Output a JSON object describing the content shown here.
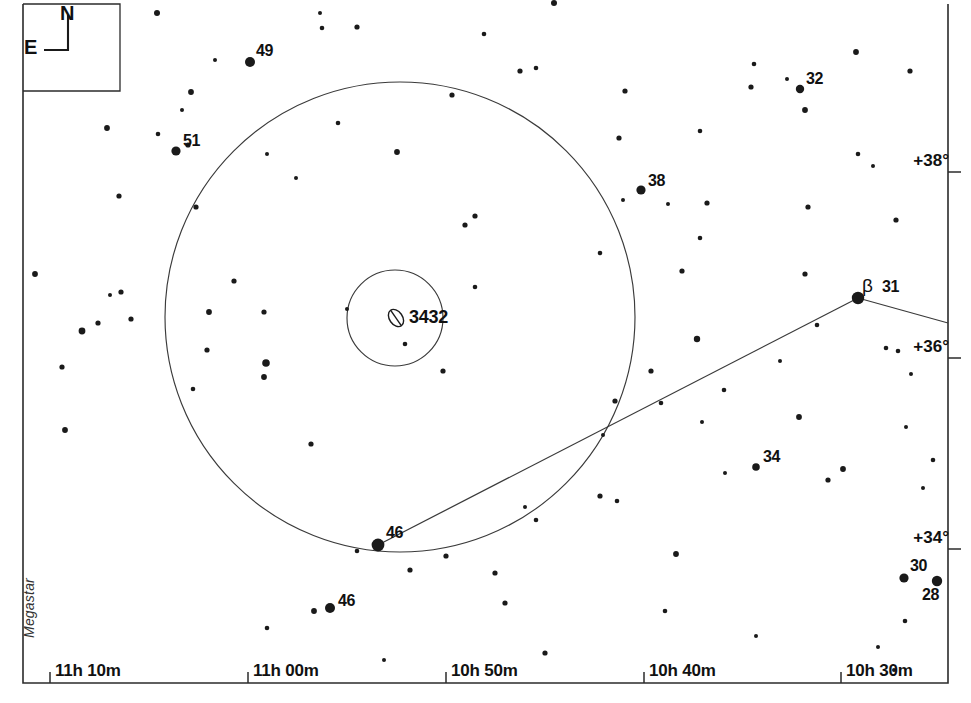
{
  "chart_data": {
    "type": "scatter",
    "title": "",
    "subtitle": "",
    "xlabel": "Right Ascension",
    "ylabel": "Declination",
    "grid": false,
    "legend_position": "none",
    "credit": "Megastar",
    "frame": {
      "left": 23,
      "top": 4,
      "right": 948,
      "bottom": 683
    },
    "ra_axis": {
      "tick_labels": [
        "11h 10m",
        "11h 00m",
        "10h 50m",
        "10h 30m",
        "10h 40m"
      ],
      "ticks": [
        {
          "label": "11h 10m",
          "x": 50
        },
        {
          "label": "11h 00m",
          "x": 248
        },
        {
          "label": "10h 50m",
          "x": 446
        },
        {
          "label": "10h 40m",
          "x": 644
        },
        {
          "label": "10h 30m",
          "x": 841
        }
      ]
    },
    "dec_axis": {
      "tick_labels": [
        "+38°",
        "+36°",
        "+34°"
      ],
      "ticks": [
        {
          "label": "+38°",
          "y": 172
        },
        {
          "label": "+36°",
          "y": 358
        },
        {
          "label": "+34°",
          "y": 549
        }
      ]
    },
    "compass": {
      "north": "N",
      "east": "E"
    },
    "deep_sky_objects": [
      {
        "name": "3432",
        "symbol": "galaxy-ellipse",
        "x": 396,
        "y": 318,
        "rx": 6.5,
        "ry": 9.5,
        "angle": -35
      }
    ],
    "finder_circles": [
      {
        "name": "outer-finder-circle",
        "cx": 400,
        "cy": 317,
        "r": 235
      },
      {
        "name": "inner-finder-circle",
        "cx": 395,
        "cy": 318,
        "r": 48
      }
    ],
    "constellation_lines": [
      {
        "x1": 378,
        "y1": 545,
        "x2": 858,
        "y2": 298
      },
      {
        "x1": 858,
        "y1": 298,
        "x2": 948,
        "y2": 323
      }
    ],
    "labeled_stars": [
      {
        "label": "49",
        "x": 250,
        "y": 62,
        "r": 5.0,
        "lx": 256,
        "ly": 42
      },
      {
        "label": "51",
        "x": 176,
        "y": 151,
        "r": 4.6,
        "lx": 183,
        "ly": 132
      },
      {
        "label": "32",
        "x": 800,
        "y": 89,
        "r": 4.2,
        "lx": 806,
        "ly": 70
      },
      {
        "label": "38",
        "x": 641,
        "y": 190,
        "r": 4.6,
        "lx": 648,
        "ly": 172
      },
      {
        "label": "31",
        "x": 858,
        "y": 298,
        "r": 6.2,
        "lx": 882,
        "ly": 278,
        "greek": "β",
        "gx": 862,
        "gy": 275
      },
      {
        "label": "34",
        "x": 756,
        "y": 467,
        "r": 3.8,
        "lx": 763,
        "ly": 448
      },
      {
        "label": "46",
        "x": 378,
        "y": 545,
        "r": 6.4,
        "lx": 386,
        "ly": 524
      },
      {
        "label": "46",
        "x": 330,
        "y": 608,
        "r": 5.0,
        "lx": 338,
        "ly": 592
      },
      {
        "label": "30",
        "x": 904,
        "y": 578,
        "r": 4.6,
        "lx": 910,
        "ly": 557
      },
      {
        "label": "28",
        "x": 937,
        "y": 581,
        "r": 5.2,
        "lx": 922,
        "ly": 586
      }
    ],
    "field_stars": [
      {
        "x": 157,
        "y": 13,
        "r": 3.0
      },
      {
        "x": 320,
        "y": 13,
        "r": 2.0
      },
      {
        "x": 322,
        "y": 28,
        "r": 2.3
      },
      {
        "x": 357,
        "y": 27,
        "r": 2.6
      },
      {
        "x": 554,
        "y": 3,
        "r": 3.0
      },
      {
        "x": 484,
        "y": 34,
        "r": 2.3
      },
      {
        "x": 520,
        "y": 71,
        "r": 2.6
      },
      {
        "x": 625,
        "y": 91,
        "r": 2.6
      },
      {
        "x": 754,
        "y": 64,
        "r": 2.3
      },
      {
        "x": 787,
        "y": 79,
        "r": 2.0
      },
      {
        "x": 751,
        "y": 87,
        "r": 2.6
      },
      {
        "x": 856,
        "y": 52,
        "r": 2.9
      },
      {
        "x": 910,
        "y": 71,
        "r": 2.6
      },
      {
        "x": 191,
        "y": 92,
        "r": 2.9
      },
      {
        "x": 188,
        "y": 145,
        "r": 2.6
      },
      {
        "x": 158,
        "y": 134,
        "r": 2.3
      },
      {
        "x": 182,
        "y": 110,
        "r": 2.0
      },
      {
        "x": 107,
        "y": 128,
        "r": 2.9
      },
      {
        "x": 196,
        "y": 207,
        "r": 2.6
      },
      {
        "x": 397,
        "y": 152,
        "r": 2.9
      },
      {
        "x": 536,
        "y": 68,
        "r": 2.3
      },
      {
        "x": 805,
        "y": 110,
        "r": 2.9
      },
      {
        "x": 858,
        "y": 154,
        "r": 2.3
      },
      {
        "x": 873,
        "y": 166,
        "r": 2.0
      },
      {
        "x": 619,
        "y": 138,
        "r": 2.6
      },
      {
        "x": 700,
        "y": 131,
        "r": 2.3
      },
      {
        "x": 623,
        "y": 200,
        "r": 2.0
      },
      {
        "x": 296,
        "y": 178,
        "r": 2.0
      },
      {
        "x": 35,
        "y": 274,
        "r": 2.9
      },
      {
        "x": 82,
        "y": 331,
        "r": 3.4
      },
      {
        "x": 98,
        "y": 323,
        "r": 2.6
      },
      {
        "x": 121,
        "y": 292,
        "r": 2.6
      },
      {
        "x": 110,
        "y": 295,
        "r": 2.0
      },
      {
        "x": 131,
        "y": 319,
        "r": 2.6
      },
      {
        "x": 62,
        "y": 367,
        "r": 2.6
      },
      {
        "x": 65,
        "y": 430,
        "r": 2.9
      },
      {
        "x": 209,
        "y": 312,
        "r": 2.9
      },
      {
        "x": 266,
        "y": 363,
        "r": 3.8
      },
      {
        "x": 215,
        "y": 60,
        "r": 2.0
      },
      {
        "x": 452,
        "y": 95,
        "r": 2.6
      },
      {
        "x": 475,
        "y": 216,
        "r": 2.6
      },
      {
        "x": 267,
        "y": 154,
        "r": 2.0
      },
      {
        "x": 234,
        "y": 281,
        "r": 2.6
      },
      {
        "x": 465,
        "y": 225,
        "r": 2.6
      },
      {
        "x": 475,
        "y": 287,
        "r": 2.3
      },
      {
        "x": 347,
        "y": 309,
        "r": 2.0
      },
      {
        "x": 264,
        "y": 312,
        "r": 2.6
      },
      {
        "x": 207,
        "y": 350,
        "r": 2.6
      },
      {
        "x": 264,
        "y": 377,
        "r": 2.9
      },
      {
        "x": 193,
        "y": 389,
        "r": 2.3
      },
      {
        "x": 443,
        "y": 371,
        "r": 2.6
      },
      {
        "x": 311,
        "y": 444,
        "r": 2.6
      },
      {
        "x": 405,
        "y": 344,
        "r": 2.3
      },
      {
        "x": 314,
        "y": 611,
        "r": 2.9
      },
      {
        "x": 267,
        "y": 628,
        "r": 2.3
      },
      {
        "x": 357,
        "y": 551,
        "r": 2.3
      },
      {
        "x": 410,
        "y": 570,
        "r": 2.6
      },
      {
        "x": 384,
        "y": 660,
        "r": 2.0
      },
      {
        "x": 446,
        "y": 556,
        "r": 2.6
      },
      {
        "x": 495,
        "y": 573,
        "r": 2.6
      },
      {
        "x": 505,
        "y": 603,
        "r": 2.6
      },
      {
        "x": 525,
        "y": 507,
        "r": 2.0
      },
      {
        "x": 536,
        "y": 520,
        "r": 2.3
      },
      {
        "x": 600,
        "y": 496,
        "r": 2.6
      },
      {
        "x": 545,
        "y": 653,
        "r": 2.6
      },
      {
        "x": 600,
        "y": 253,
        "r": 2.3
      },
      {
        "x": 668,
        "y": 204,
        "r": 2.0
      },
      {
        "x": 700,
        "y": 238,
        "r": 2.3
      },
      {
        "x": 707,
        "y": 203,
        "r": 2.6
      },
      {
        "x": 682,
        "y": 271,
        "r": 2.6
      },
      {
        "x": 697,
        "y": 339,
        "r": 3.2
      },
      {
        "x": 651,
        "y": 371,
        "r": 2.6
      },
      {
        "x": 661,
        "y": 403,
        "r": 2.3
      },
      {
        "x": 615,
        "y": 401,
        "r": 2.6
      },
      {
        "x": 603,
        "y": 435,
        "r": 2.0
      },
      {
        "x": 617,
        "y": 501,
        "r": 2.3
      },
      {
        "x": 676,
        "y": 554,
        "r": 2.9
      },
      {
        "x": 702,
        "y": 422,
        "r": 2.0
      },
      {
        "x": 799,
        "y": 417,
        "r": 2.9
      },
      {
        "x": 828,
        "y": 480,
        "r": 2.6
      },
      {
        "x": 843,
        "y": 469,
        "r": 2.9
      },
      {
        "x": 805,
        "y": 274,
        "r": 2.6
      },
      {
        "x": 817,
        "y": 325,
        "r": 2.3
      },
      {
        "x": 808,
        "y": 207,
        "r": 2.6
      },
      {
        "x": 780,
        "y": 361,
        "r": 2.0
      },
      {
        "x": 724,
        "y": 390,
        "r": 2.3
      },
      {
        "x": 725,
        "y": 473,
        "r": 2.0
      },
      {
        "x": 896,
        "y": 220,
        "r": 2.6
      },
      {
        "x": 898,
        "y": 351,
        "r": 2.3
      },
      {
        "x": 886,
        "y": 348,
        "r": 2.3
      },
      {
        "x": 911,
        "y": 374,
        "r": 2.0
      },
      {
        "x": 933,
        "y": 460,
        "r": 2.3
      },
      {
        "x": 906,
        "y": 427,
        "r": 2.0
      },
      {
        "x": 905,
        "y": 621,
        "r": 2.3
      },
      {
        "x": 878,
        "y": 647,
        "r": 2.0
      },
      {
        "x": 894,
        "y": 670,
        "r": 2.0
      },
      {
        "x": 665,
        "y": 611,
        "r": 2.3
      },
      {
        "x": 756,
        "y": 636,
        "r": 2.0
      },
      {
        "x": 338,
        "y": 123,
        "r": 2.3
      },
      {
        "x": 119,
        "y": 196,
        "r": 2.6
      },
      {
        "x": 923,
        "y": 488,
        "r": 2.0
      }
    ]
  },
  "colors": {
    "background": "#ffffff",
    "ink": "#1a1a1a",
    "line": "#3a3a3a",
    "frame": "#2b2b2b"
  }
}
